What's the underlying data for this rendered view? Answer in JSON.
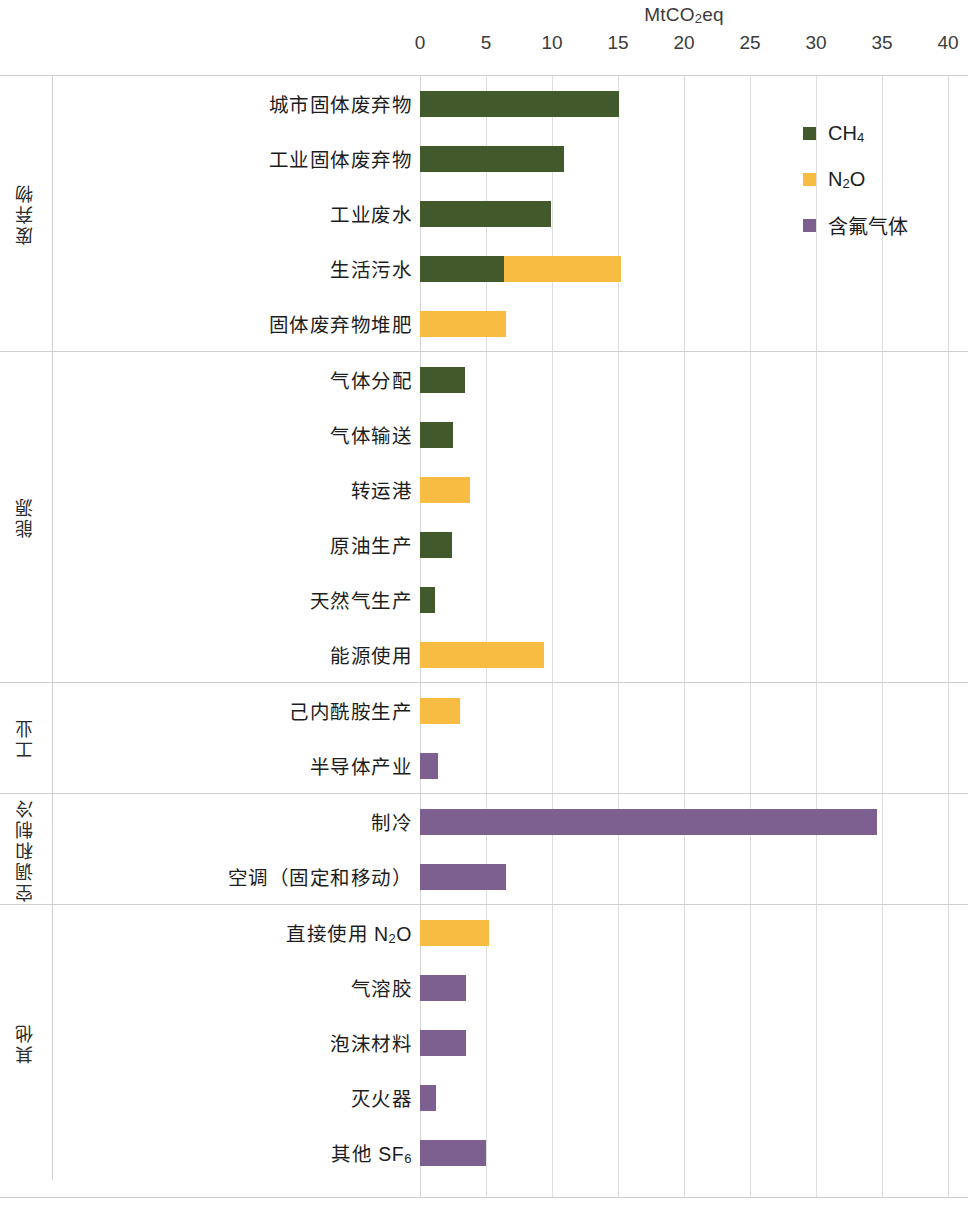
{
  "chart_data": {
    "type": "bar",
    "orientation": "horizontal",
    "stacked": true,
    "title": "MtCO2eq",
    "title_html": "MtCO<sub>2</sub>eq",
    "xlabel": "MtCO2eq",
    "ylabel": "",
    "xlim": [
      0,
      40
    ],
    "xticks": [
      0,
      5,
      10,
      15,
      20,
      25,
      30,
      35,
      40
    ],
    "xtick_labels": [
      "0",
      "5",
      "10",
      "15",
      "20",
      "25",
      "30",
      "35",
      "40"
    ],
    "grid": "vertical",
    "legend_position": "top-right",
    "series": [
      {
        "name": "CH4",
        "label_html": "CH<sub>4</sub>",
        "color": "#42592b"
      },
      {
        "name": "N2O",
        "label_html": "N<sub>2</sub>O",
        "color": "#f9bc42"
      },
      {
        "name": "含氟气体",
        "label_html": "含氟气体",
        "color": "#7d608f"
      }
    ],
    "groups": [
      {
        "name": "废弃物",
        "categories": [
          {
            "label_html": "城市固体废弃物",
            "values": {
              "CH4": 15.1,
              "N2O": 0,
              "含氟气体": 0
            }
          },
          {
            "label_html": "工业固体废弃物",
            "values": {
              "CH4": 10.9,
              "N2O": 0,
              "含氟气体": 0
            }
          },
          {
            "label_html": "工业废水",
            "values": {
              "CH4": 9.9,
              "N2O": 0,
              "含氟气体": 0
            }
          },
          {
            "label_html": "生活污水",
            "values": {
              "CH4": 6.4,
              "N2O": 8.8,
              "含氟气体": 0
            }
          },
          {
            "label_html": "固体废弃物堆肥",
            "values": {
              "CH4": 0,
              "N2O": 6.5,
              "含氟气体": 0
            }
          }
        ]
      },
      {
        "name": "能源",
        "categories": [
          {
            "label_html": "气体分配",
            "values": {
              "CH4": 3.4,
              "N2O": 0,
              "含氟气体": 0
            }
          },
          {
            "label_html": "气体输送",
            "values": {
              "CH4": 2.5,
              "N2O": 0,
              "含氟气体": 0
            }
          },
          {
            "label_html": "转运港",
            "values": {
              "CH4": 0,
              "N2O": 3.8,
              "含氟气体": 0
            }
          },
          {
            "label_html": "原油生产",
            "values": {
              "CH4": 2.4,
              "N2O": 0,
              "含氟气体": 0
            }
          },
          {
            "label_html": "天然气生产",
            "values": {
              "CH4": 1.1,
              "N2O": 0,
              "含氟气体": 0
            }
          },
          {
            "label_html": "能源使用",
            "values": {
              "CH4": 0,
              "N2O": 9.4,
              "含氟气体": 0
            }
          }
        ]
      },
      {
        "name": "工业",
        "categories": [
          {
            "label_html": "己内酰胺生产",
            "values": {
              "CH4": 0,
              "N2O": 3.0,
              "含氟气体": 0
            }
          },
          {
            "label_html": "半导体产业",
            "values": {
              "CH4": 0,
              "N2O": 0,
              "含氟气体": 1.4
            }
          }
        ]
      },
      {
        "name": "空调和制冷",
        "categories": [
          {
            "label_html": "制冷",
            "values": {
              "CH4": 0,
              "N2O": 0,
              "含氟气体": 34.6
            }
          },
          {
            "label_html": "空调（固定和移动）",
            "values": {
              "CH4": 0,
              "N2O": 0,
              "含氟气体": 6.5
            }
          }
        ]
      },
      {
        "name": "其他",
        "categories": [
          {
            "label_html": "直接使用 N<sub>2</sub>O",
            "values": {
              "CH4": 0,
              "N2O": 5.2,
              "含氟气体": 0
            }
          },
          {
            "label_html": "气溶胶",
            "values": {
              "CH4": 0,
              "N2O": 0,
              "含氟气体": 3.5
            }
          },
          {
            "label_html": "泡沫材料",
            "values": {
              "CH4": 0,
              "N2O": 0,
              "含氟气体": 3.5
            }
          },
          {
            "label_html": "灭火器",
            "values": {
              "CH4": 0,
              "N2O": 0,
              "含氟气体": 1.2
            }
          },
          {
            "label_html": "其他 SF<sub>6</sub>",
            "values": {
              "CH4": 0,
              "N2O": 0,
              "含氟气体": 5.0
            }
          }
        ]
      }
    ]
  },
  "colors": {
    "ch4": "#42592b",
    "n2o": "#f9bc42",
    "fgas": "#7d608f",
    "grid": "#dedede",
    "frame": "#cfcfcf",
    "text": "#1d1d1d"
  }
}
